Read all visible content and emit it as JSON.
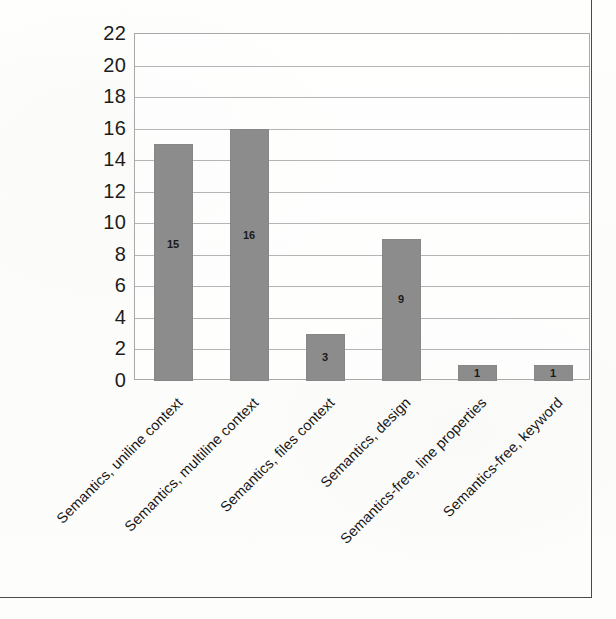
{
  "chart_data": {
    "type": "bar",
    "title": "",
    "xlabel": "",
    "ylabel": "",
    "categories": [
      "Semantics, uniline context",
      "Semantics, multiline context",
      "Semantics, files context",
      "Semantics, design",
      "Semantics-free, line properties",
      "Semantics-free, keyword"
    ],
    "values": [
      15,
      16,
      3,
      9,
      1,
      1
    ],
    "data_labels": [
      "15",
      "16",
      "3",
      "9",
      "1",
      "1"
    ],
    "ylim": [
      0,
      22
    ],
    "ytick_step": 2,
    "ytick_labels": [
      "0",
      "2",
      "4",
      "6",
      "8",
      "10",
      "12",
      "14",
      "16",
      "18",
      "20",
      "22"
    ],
    "grid": "horizontal",
    "legend": "none",
    "bar_color": "#8c8c8c",
    "gridline_color": "#b4b4b4",
    "axis_color": "#a9a9a9",
    "text_color": "#1c1c1c",
    "frame_color": "#4a4a4a",
    "background_color": "#fdfdfc"
  }
}
